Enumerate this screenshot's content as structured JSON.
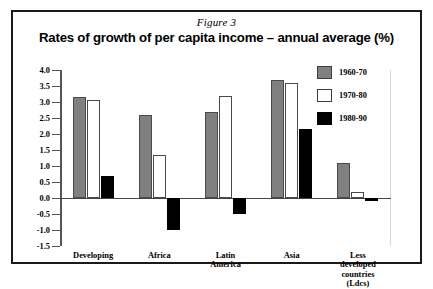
{
  "figure_label": "Figure 3",
  "chart_data": {
    "type": "bar",
    "title": "Rates of growth of per capita income – annual average (%)",
    "xlabel": "",
    "ylabel": "",
    "ylim": [
      -1.5,
      4.0
    ],
    "ytick_labels": [
      "4.0",
      "3.5",
      "3.0",
      "2.5",
      "2.0",
      "1.5",
      "1.0",
      "0.5",
      "0.0",
      "-0.5",
      "-1.0",
      "-1.5"
    ],
    "ytick_values": [
      4.0,
      3.5,
      3.0,
      2.5,
      2.0,
      1.5,
      1.0,
      0.5,
      0.0,
      -0.5,
      -1.0,
      -1.5
    ],
    "grid": false,
    "legend_position": "top-right",
    "categories": [
      "Developing",
      "Africa",
      "Latin\nAmerica",
      "Asia",
      "Less\ndeveloped\ncountries\n(Ldcs)"
    ],
    "series": [
      {
        "name": "1960-70",
        "color": "#808080",
        "values": [
          3.15,
          2.6,
          2.7,
          3.7,
          1.1
        ]
      },
      {
        "name": "1970-80",
        "color": "#ffffff",
        "values": [
          3.05,
          1.35,
          3.2,
          3.6,
          0.2
        ]
      },
      {
        "name": "1980-90",
        "color": "#000000",
        "values": [
          0.7,
          -1.0,
          -0.5,
          2.15,
          -0.1
        ]
      }
    ]
  }
}
